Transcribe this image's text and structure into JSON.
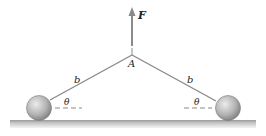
{
  "diagram": {
    "force_label": "F",
    "point_label": "A",
    "rod_left_label": "b",
    "rod_right_label": "b",
    "angle_left_label": "θ",
    "angle_right_label": "θ",
    "colors": {
      "rod": "#8a8a8a",
      "arrow": "#8a8a8a",
      "ball_light": "#e6e6e6",
      "ball_dark": "#8c8c8c",
      "ground_top": "#a8a8a8",
      "ground_bottom": "#f0f0f0",
      "text": "#222222"
    }
  }
}
